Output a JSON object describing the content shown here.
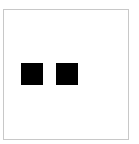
{
  "canvas": {
    "background": "#ffffff",
    "border_color": "#c8c8c8"
  },
  "squares": [
    {
      "color": "#000000",
      "x": 21,
      "y": 63,
      "size": 22
    },
    {
      "color": "#000000",
      "x": 56,
      "y": 63,
      "size": 22
    }
  ]
}
